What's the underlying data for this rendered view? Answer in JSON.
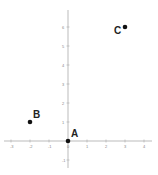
{
  "chart_data": {
    "type": "scatter",
    "title": "",
    "xlabel": "",
    "ylabel": "",
    "xlim": [
      -3.5,
      4.5
    ],
    "ylim": [
      -1.5,
      6.5
    ],
    "grid": false,
    "x_ticks": [
      -3,
      -2,
      -1,
      0,
      1,
      2,
      3,
      4
    ],
    "y_ticks": [
      -1,
      1,
      2,
      3,
      4,
      5,
      6
    ],
    "points": [
      {
        "label": "A",
        "x": 0,
        "y": 0
      },
      {
        "label": "B",
        "x": -2,
        "y": 1
      },
      {
        "label": "C",
        "x": 3,
        "y": 6
      }
    ]
  },
  "labels": {
    "A": "A",
    "B": "B",
    "C": "C"
  },
  "colors": {
    "axis": "#999999",
    "point": "#111111",
    "label": "#222222"
  }
}
